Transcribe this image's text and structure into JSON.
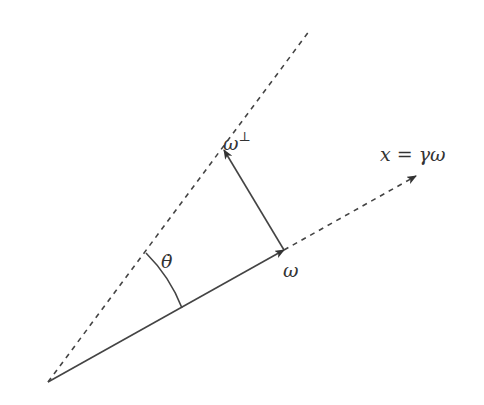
{
  "diagram": {
    "labels": {
      "omega_perp_base": "ω",
      "omega_perp_sup": "⊥",
      "x_eq": "x = γω",
      "theta_dot": "θ̇",
      "omega": "ω"
    },
    "colors": {
      "stroke": "#444444",
      "text": "#333333",
      "background": "#ffffff"
    },
    "elements": [
      "dashed line from origin toward upper-right (the ω⊥ direction line)",
      "solid vector ω from origin",
      "dashed extension of ω toward x = γω with arrowhead",
      "solid vector ω⊥ from tip of ω to dashed line with arrowhead",
      "arc marking angle θ̇ between the two lines"
    ]
  }
}
